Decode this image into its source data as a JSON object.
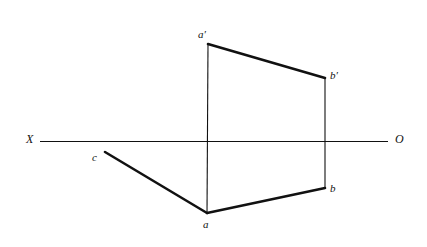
{
  "figure": {
    "type": "orthographic-projection-diagram",
    "background_color": "#ffffff",
    "stroke_color": "#111111",
    "width": 427,
    "height": 247
  },
  "axis": {
    "name": "ground-line",
    "left_label": "X",
    "right_label": "O",
    "x1": 40,
    "y1": 141,
    "x2": 388,
    "y2": 141,
    "stroke_width": 1,
    "left_label_x": 26,
    "left_label_y": 134,
    "right_label_x": 395,
    "right_label_y": 134
  },
  "points": [
    {
      "id": "a-prime",
      "label": "a′",
      "x": 208,
      "y": 44,
      "label_x": 198,
      "label_y": 29
    },
    {
      "id": "b-prime",
      "label": "b′",
      "x": 325,
      "y": 78,
      "label_x": 330,
      "label_y": 70
    },
    {
      "id": "a",
      "label": "a",
      "x": 207,
      "y": 213,
      "label_x": 203,
      "label_y": 219
    },
    {
      "id": "b",
      "label": "b",
      "x": 325,
      "y": 188,
      "label_x": 330,
      "label_y": 183
    },
    {
      "id": "c",
      "label": "c",
      "x": 105,
      "y": 152,
      "label_x": 92,
      "label_y": 152
    }
  ],
  "segments": [
    {
      "id": "front-view-top-edge",
      "from": "a-prime",
      "to": "b-prime",
      "x1": 208,
      "y1": 44,
      "x2": 325,
      "y2": 78,
      "stroke_width": 2.6
    },
    {
      "id": "top-view-edge-c-a",
      "from": "c",
      "to": "a",
      "x1": 105,
      "y1": 152,
      "x2": 207,
      "y2": 213,
      "stroke_width": 2.6
    },
    {
      "id": "top-view-edge-a-b",
      "from": "a",
      "to": "b",
      "x1": 207,
      "y1": 213,
      "x2": 325,
      "y2": 188,
      "stroke_width": 2.6
    },
    {
      "id": "projector-a-prime-a",
      "from": "a-prime",
      "to": "a",
      "x1": 208,
      "y1": 44,
      "x2": 207,
      "y2": 213,
      "stroke_width": 1.1
    },
    {
      "id": "projector-b-prime-b",
      "from": "b-prime",
      "to": "b",
      "x1": 325,
      "y1": 78,
      "x2": 325,
      "y2": 188,
      "stroke_width": 1.1
    }
  ]
}
